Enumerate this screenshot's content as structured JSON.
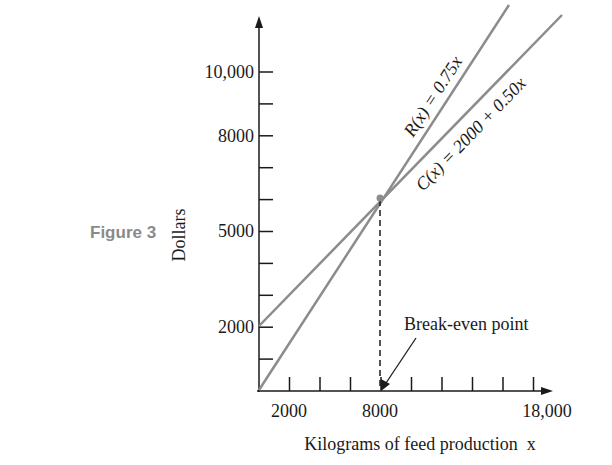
{
  "figure_label": "Figure 3",
  "chart_data": {
    "type": "line",
    "title": "",
    "xlabel": "Kilograms of feed production  x",
    "ylabel": "Dollars",
    "xlim": [
      0,
      18000
    ],
    "ylim": [
      0,
      11000
    ],
    "x_tick_step": 2000,
    "y_tick_step": 1000,
    "x_tick_labels": [
      {
        "value": 2000,
        "label": "2000"
      },
      {
        "value": 8000,
        "label": "8000"
      },
      {
        "value": 18000,
        "label": "18,000"
      }
    ],
    "y_tick_labels": [
      {
        "value": 2000,
        "label": "2000"
      },
      {
        "value": 5000,
        "label": "5000"
      },
      {
        "value": 8000,
        "label": "8000"
      },
      {
        "value": 10000,
        "label": "10,000"
      }
    ],
    "grid": false,
    "series": [
      {
        "name": "R(x) = 0.75x",
        "label": "R(x) = 0.75x",
        "x": [
          0,
          8000,
          16000
        ],
        "values": [
          0,
          6000,
          12000
        ]
      },
      {
        "name": "C(x) = 2000 + 0.50x",
        "label": "C(x) = 2000 + 0.50x",
        "x": [
          0,
          8000,
          19000
        ],
        "values": [
          2000,
          6000,
          11500
        ]
      }
    ],
    "annotations": [
      {
        "text": "Break-even point",
        "x": 8000,
        "y": 6000
      }
    ],
    "line_color": "#8c8c8c"
  }
}
